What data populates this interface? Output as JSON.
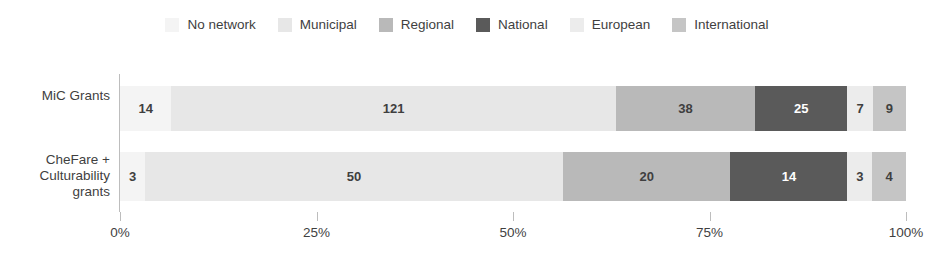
{
  "chart_data": {
    "type": "bar",
    "orientation": "horizontal",
    "stacked": true,
    "normalized": true,
    "title": "",
    "subtitle": "",
    "xlabel": "",
    "ylabel": "",
    "grid": false,
    "legend_position": "top-center",
    "xlim": [
      0,
      100
    ],
    "x_tick_labels": [
      "0%",
      "25%",
      "50%",
      "75%",
      "100%"
    ],
    "x_tick_values": [
      0,
      25,
      50,
      75,
      100
    ],
    "categories": [
      "MiC Grants",
      "CheFare + Culturability grants"
    ],
    "series": [
      {
        "name": "No network",
        "color": "#f4f4f4",
        "values": [
          14,
          3
        ]
      },
      {
        "name": "Municipal",
        "color": "#e7e7e7",
        "values": [
          121,
          50
        ]
      },
      {
        "name": "Regional",
        "color": "#b9b9b9",
        "values": [
          38,
          20
        ]
      },
      {
        "name": "National",
        "color": "#5a5a5a",
        "values": [
          25,
          14
        ]
      },
      {
        "name": "European",
        "color": "#ececec",
        "values": [
          7,
          3
        ]
      },
      {
        "name": "International",
        "color": "#c5c5c5",
        "values": [
          9,
          4
        ]
      }
    ],
    "row_totals": [
      214,
      94
    ],
    "bars": [
      {
        "category": "MiC Grants",
        "total": 214,
        "segments": [
          {
            "series": "No network",
            "value": "14",
            "percent": 6.54,
            "color": "#f4f4f4",
            "label_color": "#3f3f3f"
          },
          {
            "series": "Municipal",
            "value": "121",
            "percent": 56.54,
            "color": "#e7e7e7",
            "label_color": "#3f3f3f"
          },
          {
            "series": "Regional",
            "value": "38",
            "percent": 17.76,
            "color": "#b9b9b9",
            "label_color": "#3f3f3f"
          },
          {
            "series": "National",
            "value": "25",
            "percent": 11.68,
            "color": "#5a5a5a",
            "label_color": "#ffffff"
          },
          {
            "series": "European",
            "value": "7",
            "percent": 3.27,
            "color": "#ececec",
            "label_color": "#3f3f3f"
          },
          {
            "series": "International",
            "value": "9",
            "percent": 4.21,
            "color": "#c5c5c5",
            "label_color": "#3f3f3f"
          }
        ]
      },
      {
        "category": "CheFare + Culturability grants",
        "total": 94,
        "segments": [
          {
            "series": "No network",
            "value": "3",
            "percent": 3.19,
            "color": "#f4f4f4",
            "label_color": "#3f3f3f"
          },
          {
            "series": "Municipal",
            "value": "50",
            "percent": 53.19,
            "color": "#e7e7e7",
            "label_color": "#3f3f3f"
          },
          {
            "series": "Regional",
            "value": "20",
            "percent": 21.28,
            "color": "#b9b9b9",
            "label_color": "#3f3f3f"
          },
          {
            "series": "National",
            "value": "14",
            "percent": 14.89,
            "color": "#5a5a5a",
            "label_color": "#ffffff"
          },
          {
            "series": "European",
            "value": "3",
            "percent": 3.19,
            "color": "#ececec",
            "label_color": "#3f3f3f"
          },
          {
            "series": "International",
            "value": "4",
            "percent": 4.26,
            "color": "#c5c5c5",
            "label_color": "#3f3f3f"
          }
        ]
      }
    ]
  },
  "legend": {
    "items": [
      {
        "label": "No network",
        "color": "#f4f4f4"
      },
      {
        "label": "Municipal",
        "color": "#e7e7e7"
      },
      {
        "label": "Regional",
        "color": "#b9b9b9"
      },
      {
        "label": "National",
        "color": "#5a5a5a"
      },
      {
        "label": "European",
        "color": "#ececec"
      },
      {
        "label": "International",
        "color": "#c5c5c5"
      }
    ]
  },
  "y_axis": {
    "labels": [
      {
        "lines": [
          "MiC Grants"
        ]
      },
      {
        "lines": [
          "CheFare +",
          "Culturability",
          "grants"
        ]
      }
    ]
  },
  "x_axis": {
    "ticks": [
      "0%",
      "25%",
      "50%",
      "75%",
      "100%"
    ]
  },
  "colors": {
    "axis": "#bdbdbd",
    "text": "#3f3f3f",
    "background": "#ffffff"
  }
}
